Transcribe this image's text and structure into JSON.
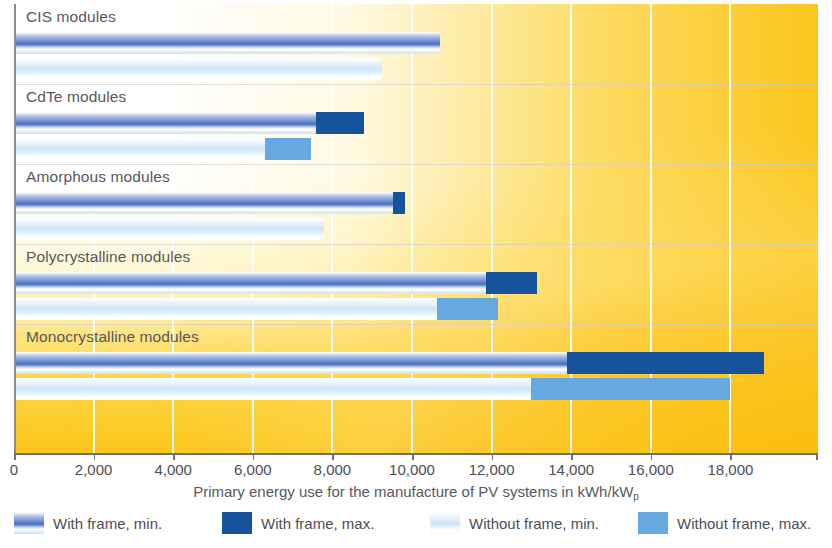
{
  "chart_data": {
    "type": "bar",
    "orientation": "horizontal",
    "title": "",
    "xlabel": "Primary energy use for the manufacture of PV systems in kWh/kW",
    "xlabel_subscript": "p",
    "ylabel": "",
    "xlim": [
      0,
      20000
    ],
    "xticks": [
      0,
      2000,
      4000,
      6000,
      8000,
      10000,
      12000,
      14000,
      16000,
      18000
    ],
    "xtick_labels": [
      "0",
      "2,000",
      "4,000",
      "6,000",
      "8,000",
      "10,000",
      "12,000",
      "14,000",
      "16,000",
      "18,000"
    ],
    "grid": "vertical",
    "legend_position": "bottom",
    "categories": [
      "CIS modules",
      "CdTe modules",
      "Amorphous modules",
      "Polycrystalline modules",
      "Monocrystalline modules"
    ],
    "series": [
      {
        "name": "With frame, min.",
        "key": "wf_min",
        "color": "#6f8fd0",
        "values": [
          10700,
          7600,
          9530,
          11850,
          13900
        ]
      },
      {
        "name": "With frame, max.",
        "key": "wf_max",
        "color": "#17539a",
        "values": [
          10700,
          8800,
          9820,
          13150,
          18850
        ]
      },
      {
        "name": "Without frame, min.",
        "key": "wof_min",
        "color": "#cbe6fa",
        "values": [
          9250,
          6300,
          7800,
          10620,
          13000
        ]
      },
      {
        "name": "Without frame, max.",
        "key": "wof_max",
        "color": "#66a8e0",
        "values": [
          9250,
          7450,
          7800,
          12150,
          18000
        ]
      }
    ]
  },
  "rows": [
    {
      "label": "CIS modules",
      "wf_min": 10700,
      "wf_max": 10700,
      "wof_min": 9250,
      "wof_max": 9250
    },
    {
      "label": "CdTe modules",
      "wf_min": 7600,
      "wf_max": 8800,
      "wof_min": 6300,
      "wof_max": 7450
    },
    {
      "label": "Amorphous modules",
      "wf_min": 9530,
      "wf_max": 9820,
      "wof_min": 7800,
      "wof_max": 7800
    },
    {
      "label": "Polycrystalline modules",
      "wf_min": 11850,
      "wf_max": 13150,
      "wof_min": 10620,
      "wof_max": 12150
    },
    {
      "label": "Monocrystalline modules",
      "wf_min": 13900,
      "wf_max": 18850,
      "wof_min": 13000,
      "wof_max": 18000
    }
  ],
  "axis": {
    "tick_labels": [
      "0",
      "2,000",
      "4,000",
      "6,000",
      "8,000",
      "10,000",
      "12,000",
      "14,000",
      "16,000",
      "18,000"
    ],
    "tick_values": [
      0,
      2000,
      4000,
      6000,
      8000,
      10000,
      12000,
      14000,
      16000,
      18000
    ],
    "title_main": "Primary energy use for the manufacture of PV systems in kWh/kW",
    "title_sub": "p"
  },
  "legend": {
    "items": [
      {
        "label": "With frame, min.",
        "swatch": "wf-min",
        "color": "#6f8fd0"
      },
      {
        "label": "With frame, max.",
        "swatch": "wf-max",
        "color": "#17539a"
      },
      {
        "label": "Without frame, min.",
        "swatch": "wof-min",
        "color": "#cbe6fa"
      },
      {
        "label": "Without frame, max.",
        "swatch": "wof-max",
        "color": "#66a8e0"
      }
    ]
  },
  "colors": {
    "with_frame_min": "#6f8fd0",
    "with_frame_max": "#17539a",
    "without_frame_min": "#cbe6fa",
    "without_frame_max": "#66a8e0",
    "background_accent": "#fac000",
    "text": "#58585c"
  }
}
